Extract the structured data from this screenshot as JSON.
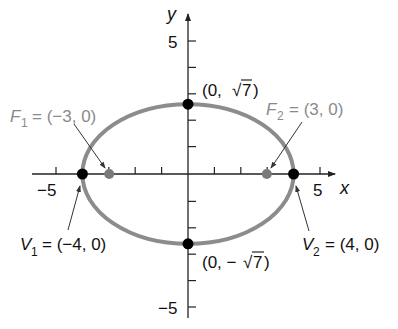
{
  "diagram": {
    "type": "ellipse-graph",
    "equation_params": {
      "a": 4,
      "b_label": "√7",
      "c": 3
    },
    "axes": {
      "x_label": "x",
      "y_label": "y",
      "x_tick_labels": {
        "neg": "−5",
        "pos": "5"
      },
      "y_tick_labels": {
        "pos": "5",
        "neg": "−5"
      },
      "range": [
        -5,
        5
      ]
    },
    "points": {
      "v1": {
        "name": "V",
        "sub": "1",
        "coords": "= (−4, 0)"
      },
      "v2": {
        "name": "V",
        "sub": "2",
        "coords": "= (4, 0)"
      },
      "f1": {
        "name": "F",
        "sub": "1",
        "coords": "= (−3, 0)"
      },
      "f2": {
        "name": "F",
        "sub": "2",
        "coords": "= (3, 0)"
      },
      "top": {
        "label_pre": "(0, ",
        "root": "√",
        "radicand": "7",
        "label_post": ")"
      },
      "bottom": {
        "label_pre": "(0, −",
        "root": "√",
        "radicand": "7",
        "label_post": " )"
      }
    },
    "colors": {
      "ellipse": "#8c8c8c",
      "vertex": "#000000",
      "focus": "#7a7a7a",
      "axis": "#222222",
      "focus_label": "#8a8a8a"
    }
  }
}
